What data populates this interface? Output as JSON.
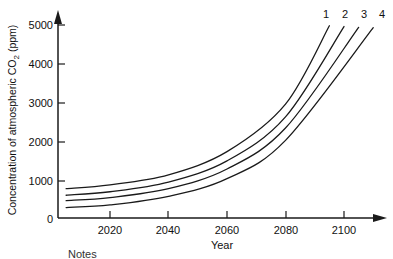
{
  "chart_data": {
    "type": "line",
    "title": "",
    "xlabel": "Year",
    "ylabel": "Concentration of atmospheric CO2 (ppm)",
    "ylabel_parts": {
      "lead": "Concentration of atmospheric CO",
      "sub": "2",
      "tail": " (ppm)"
    },
    "xlim": [
      2005,
      2120
    ],
    "ylim": [
      0,
      5600
    ],
    "grid": false,
    "legend_position": "curve-end-labels",
    "x_ticks": [
      2020,
      2040,
      2060,
      2080,
      2100
    ],
    "x_tick_labels": [
      "2020",
      "2040",
      "2060",
      "2080",
      "2100"
    ],
    "y_ticks": [
      0,
      1000,
      2000,
      3000,
      4000,
      5000
    ],
    "y_tick_labels": [
      "0",
      "1000",
      "2000",
      "3000",
      "4000",
      "5000"
    ],
    "x": [
      2005,
      2020,
      2040,
      2060,
      2080,
      2095,
      2100,
      2105,
      2110
    ],
    "series": [
      {
        "name": "1",
        "label": "1",
        "color": "#1a1a1a",
        "x": [
          2005,
          2020,
          2040,
          2060,
          2080,
          2095
        ],
        "values": [
          760,
          860,
          1120,
          1720,
          2950,
          4980
        ]
      },
      {
        "name": "2",
        "label": "2",
        "color": "#1a1a1a",
        "x": [
          2005,
          2020,
          2040,
          2060,
          2080,
          2100
        ],
        "values": [
          590,
          680,
          930,
          1480,
          2620,
          4960
        ]
      },
      {
        "name": "3",
        "label": "3",
        "color": "#1a1a1a",
        "x": [
          2005,
          2020,
          2040,
          2060,
          2080,
          2105
        ],
        "values": [
          450,
          530,
          760,
          1270,
          2330,
          4940
        ]
      },
      {
        "name": "4",
        "label": "4",
        "color": "#1a1a1a",
        "x": [
          2005,
          2020,
          2040,
          2060,
          2080,
          2110
        ],
        "values": [
          270,
          340,
          560,
          1020,
          2010,
          4930
        ]
      }
    ]
  },
  "figure": {
    "axis_color": "#1a1a1a",
    "background": "#ffffff",
    "x_axis_title": "Year",
    "curve_labels": [
      "1",
      "2",
      "3",
      "4"
    ]
  },
  "footer": {
    "notes_label": "Notes"
  }
}
